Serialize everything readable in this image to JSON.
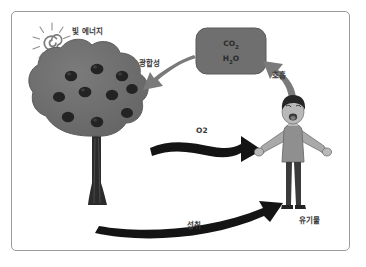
{
  "diagram": {
    "title_present": false,
    "background_color": "#ffffff",
    "frame_color": "#9b9b9b",
    "labels": {
      "light_energy": "빛 에너지",
      "photosynthesis": "광합성",
      "respiration": "호흡",
      "oxygen": "O2",
      "ingestion": "섭취",
      "organic_matter": "유기물"
    },
    "compound_box": {
      "carbon_dioxide": "CO",
      "carbon_dioxide_sub": "2",
      "water": "H",
      "water_sub": "2",
      "water_tail": "O",
      "fill_color": "#6f6f6f"
    },
    "nodes": [
      {
        "name": "sun",
        "type": "spiral-sun",
        "color": "#8a8a8a"
      },
      {
        "name": "tree",
        "type": "broadleaf-tree",
        "canopy_color": "#6d6d6d",
        "fruit_color": "#2a2a2a",
        "trunk_color": "#2b2b2b",
        "fruit_count": 10
      },
      {
        "name": "gas-box",
        "type": "rounded-rect",
        "color": "#6f6f6f"
      },
      {
        "name": "person",
        "type": "boy-arms-out",
        "shirt_color": "#8f8f8f",
        "pants_color": "#3a3a3a",
        "hair_color": "#262626",
        "skin_color": "#b9b9b9"
      }
    ],
    "arrows": [
      {
        "name": "photosynthesis-arrow",
        "from": "gas-box",
        "to": "tree",
        "color": "#777777",
        "style": "tapered"
      },
      {
        "name": "respiration-arrow",
        "from": "person",
        "to": "gas-box",
        "color": "#777777",
        "style": "curved"
      },
      {
        "name": "oxygen-arrow",
        "from": "tree",
        "to": "person",
        "color": "#111111",
        "style": "thick-wavy"
      },
      {
        "name": "ingestion-arrow",
        "from": "tree",
        "to": "person",
        "color": "#111111",
        "style": "thick-curved"
      }
    ]
  }
}
